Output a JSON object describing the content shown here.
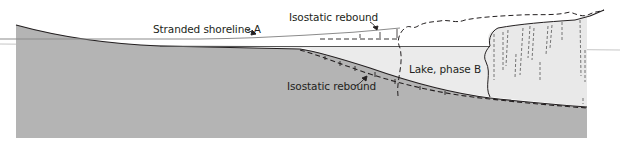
{
  "diagram": {
    "labels": {
      "stranded_shoreline": "Stranded shoreline A",
      "isostatic_rebound_upper": "Isostatic rebound",
      "isostatic_rebound_lower": "Isostatic rebound",
      "lake": "Lake, phase B"
    },
    "colors": {
      "ground": "#b4b4b4",
      "lake": "#ebebeb",
      "ice": "#e9e9e9",
      "outline": "#231f20",
      "shoreline": "#8c8c8c",
      "water_level": "#9a9a9a"
    },
    "elements": [
      "ground-profile",
      "lake-phase-b",
      "ice-sheet",
      "former-ice-extent-dashed",
      "stranded-shoreline-a",
      "former-ground-profile-dashed"
    ]
  }
}
